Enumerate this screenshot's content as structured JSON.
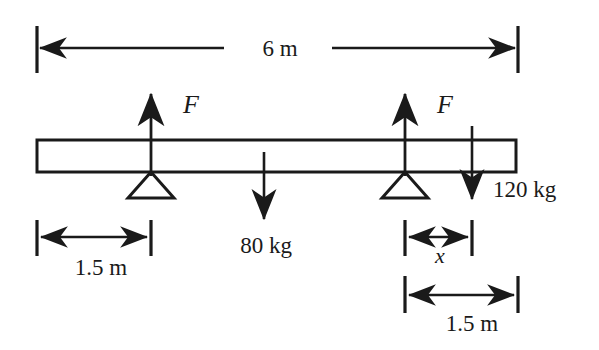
{
  "figure": {
    "type": "free-body-diagram",
    "background_color": "#ffffff",
    "line_color": "#1a1a1a"
  },
  "beam": {
    "label": "beam",
    "left_x": 37,
    "right_x": 516,
    "top_y": 140,
    "bottom_y": 172
  },
  "dimensions": [
    {
      "id": "overall-span",
      "value": "6 m",
      "from_x": 37,
      "to_x": 518,
      "line_y": 48,
      "tick_top": 26,
      "tick_bottom": 73,
      "label_x": 280,
      "label_y": 55,
      "label_gap_left": 187,
      "label_gap_right": 320
    },
    {
      "id": "left-support-offset",
      "value": "1.5 m",
      "from_x": 37,
      "to_x": 151,
      "line_y": 237,
      "tick_top": 220,
      "tick_bottom": 255,
      "label_x": 101,
      "label_y": 274
    },
    {
      "id": "load-offset-x",
      "value": "x",
      "from_x": 405,
      "to_x": 472,
      "line_y": 237,
      "tick_top": 220,
      "tick_bottom": 255,
      "label_x": 440,
      "label_y": 262
    },
    {
      "id": "right-support-to-end",
      "value": "1.5 m",
      "from_x": 405,
      "to_x": 518,
      "line_y": 295,
      "tick_top": 276,
      "tick_bottom": 312,
      "label_x": 472,
      "label_y": 330
    }
  ],
  "supports": [
    {
      "id": "support-left",
      "name": "triangular-support",
      "apex_x": 151,
      "apex_y": 172,
      "base_y": 198,
      "half_width": 23
    },
    {
      "id": "support-right",
      "name": "triangular-support",
      "apex_x": 405,
      "apex_y": 172,
      "base_y": 198,
      "half_width": 23
    }
  ],
  "forces": [
    {
      "id": "reaction-force-left",
      "label": "F",
      "direction": "up",
      "x": 151,
      "tail_y": 172,
      "tip_y": 91,
      "label_x": 183,
      "label_y": 112
    },
    {
      "id": "reaction-force-right",
      "label": "F",
      "direction": "up",
      "x": 405,
      "tail_y": 172,
      "tip_y": 91,
      "label_x": 437,
      "label_y": 112
    }
  ],
  "loads": [
    {
      "id": "load-80kg",
      "label": "80 kg",
      "direction": "down",
      "x": 264,
      "tail_y": 172,
      "tip_y": 223,
      "label_x": 266,
      "label_y": 253
    },
    {
      "id": "load-120kg",
      "label": "120 kg",
      "direction": "down",
      "x": 472,
      "tail_y": 126,
      "tip_y": 203,
      "label_x": 493,
      "label_y": 197
    }
  ]
}
